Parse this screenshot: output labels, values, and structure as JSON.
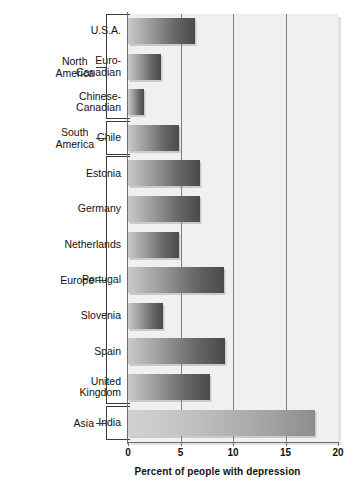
{
  "chart_data": {
    "type": "bar",
    "orientation": "horizontal",
    "title": "",
    "xlabel": "Percent of people with depression",
    "ylabel": "",
    "xlim": [
      0,
      20
    ],
    "xticks": [
      0,
      5,
      10,
      15,
      20
    ],
    "xtick_labels": [
      "0",
      "5",
      "10",
      "15",
      "20"
    ],
    "grid": true,
    "grid_axis": "x",
    "legend": null,
    "categories": [
      "U.S.A.",
      "Euro-Canadian",
      "Chinese-Canadian",
      "Chile",
      "Estonia",
      "Germany",
      "Netherlands",
      "Portugal",
      "Slovenia",
      "Spain",
      "United Kingdom",
      "India"
    ],
    "values": [
      6.4,
      3.1,
      1.5,
      4.9,
      6.9,
      6.9,
      4.9,
      9.1,
      3.3,
      9.2,
      7.8,
      17.8
    ],
    "groups": [
      {
        "label": "North America",
        "categories": [
          "U.S.A.",
          "Euro-Canadian",
          "Chinese-Canadian"
        ]
      },
      {
        "label": "South America",
        "categories": [
          "Chile"
        ]
      },
      {
        "label": "Europe",
        "categories": [
          "Estonia",
          "Germany",
          "Netherlands",
          "Portugal",
          "Slovenia",
          "Spain",
          "United Kingdom"
        ]
      },
      {
        "label": "Asia",
        "categories": [
          "India"
        ]
      }
    ]
  },
  "rows": [
    {
      "label_line1": "U.S.A.",
      "label_line2": "",
      "value": 6.4,
      "style": "dark"
    },
    {
      "label_line1": "Euro-",
      "label_line2": "Canadian",
      "value": 3.1,
      "style": "dark"
    },
    {
      "label_line1": "Chinese-",
      "label_line2": "Canadian",
      "value": 1.5,
      "style": "dark"
    },
    {
      "label_line1": "Chile",
      "label_line2": "",
      "value": 4.9,
      "style": "dark"
    },
    {
      "label_line1": "Estonia",
      "label_line2": "",
      "value": 6.9,
      "style": "dark"
    },
    {
      "label_line1": "Germany",
      "label_line2": "",
      "value": 6.9,
      "style": "dark"
    },
    {
      "label_line1": "Netherlands",
      "label_line2": "",
      "value": 4.9,
      "style": "dark"
    },
    {
      "label_line1": "Portugal",
      "label_line2": "",
      "value": 9.1,
      "style": "dark"
    },
    {
      "label_line1": "Slovenia",
      "label_line2": "",
      "value": 3.3,
      "style": "dark"
    },
    {
      "label_line1": "Spain",
      "label_line2": "",
      "value": 9.2,
      "style": "dark"
    },
    {
      "label_line1": "United",
      "label_line2": "Kingdom",
      "value": 7.8,
      "style": "dark"
    },
    {
      "label_line1": "India",
      "label_line2": "",
      "value": 17.8,
      "style": "light"
    }
  ],
  "groups": [
    {
      "label_line1": "North",
      "label_line2": "America"
    },
    {
      "label_line1": "South",
      "label_line2": "America"
    },
    {
      "label_line1": "Europe",
      "label_line2": ""
    },
    {
      "label_line1": "Asia",
      "label_line2": ""
    }
  ],
  "axis": {
    "x_title": "Percent of people with depression",
    "ticks": [
      "0",
      "5",
      "10",
      "15",
      "20"
    ]
  },
  "colors": {
    "plot_background": "#f0f0ef",
    "bar_dark_start": "#c9c9c9",
    "bar_dark_end": "#4a4a4a",
    "bar_light_start": "#d2d2d2",
    "bar_light_end": "#8d8d8d",
    "gridline": "#808080",
    "axis": "#6e6e6e",
    "text": "#15100f"
  }
}
